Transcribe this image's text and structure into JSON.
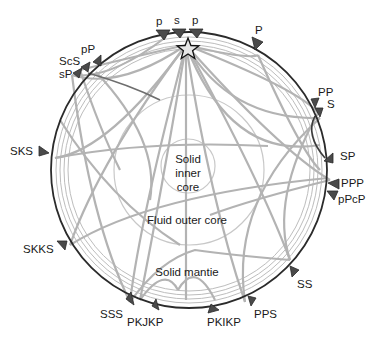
{
  "diagram": {
    "title": "",
    "source_symbol": "star-icon",
    "regions": {
      "inner_core": [
        "Solid",
        "inner",
        "core"
      ],
      "outer_core": "Fluid outer core",
      "mantle": "Solid mantie"
    },
    "stations": [
      {
        "id": "p1",
        "label": "p"
      },
      {
        "id": "s",
        "label": "s"
      },
      {
        "id": "p2",
        "label": "p"
      },
      {
        "id": "P",
        "label": "P"
      },
      {
        "id": "PP",
        "label": "PP"
      },
      {
        "id": "S",
        "label": "S"
      },
      {
        "id": "SP",
        "label": "SP"
      },
      {
        "id": "PPP",
        "label": "PPP"
      },
      {
        "id": "pPcP",
        "label": "pPcP"
      },
      {
        "id": "SS",
        "label": "SS"
      },
      {
        "id": "PPS",
        "label": "PPS"
      },
      {
        "id": "PKIKP",
        "label": "PKIKP"
      },
      {
        "id": "PKJKP",
        "label": "PKJKP"
      },
      {
        "id": "SSS",
        "label": "SSS"
      },
      {
        "id": "SKKS",
        "label": "SKKS"
      },
      {
        "id": "SKS",
        "label": "SKS"
      },
      {
        "id": "sP",
        "label": "sP"
      },
      {
        "id": "ScS",
        "label": "ScS"
      },
      {
        "id": "pP",
        "label": "pP"
      }
    ],
    "colors": {
      "earth_outline": "#2b2b2b",
      "ray_paths": "#b3b3b3",
      "station_markers": "#4a4a4a",
      "text": "#1a1a1a"
    }
  }
}
